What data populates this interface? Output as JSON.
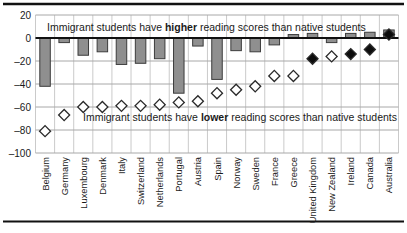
{
  "chart_data": {
    "type": "bar",
    "categories": [
      "Belgium",
      "Germany",
      "Luxembourg",
      "Denmark",
      "Italy",
      "Switzerland",
      "Netherlands",
      "Portugal",
      "Austria",
      "Spain",
      "Norway",
      "Sweden",
      "France",
      "Greece",
      "United Kingdom",
      "New Zealand",
      "Ireland",
      "Canada",
      "Australia"
    ],
    "series": [
      {
        "name": "bar-score-difference",
        "type": "bar",
        "values": [
          -42,
          -4,
          -15,
          -12,
          -23,
          -22,
          -18,
          -48,
          -7,
          -36,
          -11,
          -12,
          -6,
          3,
          4,
          -4,
          4,
          5,
          7
        ]
      },
      {
        "name": "diamond-score-difference",
        "type": "scatter",
        "marker": "diamond",
        "values": [
          -81,
          -67,
          -60,
          -60,
          -59,
          -59,
          -58,
          -56,
          -55,
          -48,
          -45,
          -42,
          -33,
          -33,
          -18,
          -16,
          -14,
          -10,
          3
        ],
        "filled": [
          false,
          false,
          false,
          false,
          false,
          false,
          false,
          false,
          false,
          false,
          false,
          false,
          false,
          false,
          true,
          false,
          true,
          true,
          true
        ]
      }
    ],
    "annotations": [
      {
        "id": "higher",
        "pre": "Immigrant students have ",
        "bold": "higher",
        "post": " reading scores than native students"
      },
      {
        "id": "lower",
        "pre": "Immigrant students have ",
        "bold": "lower",
        "post": " reading scores than native students"
      }
    ],
    "yticks": [
      20,
      0,
      -20,
      -40,
      -60,
      -80,
      -100
    ],
    "ylim": [
      -100,
      20
    ],
    "grid": true,
    "legend": "none",
    "colors": {
      "bar_fill": "#8f8f8f",
      "bar_border": "#3c3c3c",
      "diamond_open_fill": "#ffffff",
      "diamond_filled_fill": "#0d0d0d",
      "diamond_border": "#2a2a2a",
      "grid_line": "#a8a8a8",
      "column_line": "#bcbcbc",
      "zero_line": "#111111",
      "rule": "#111111",
      "text": "#1a1a1a"
    }
  }
}
